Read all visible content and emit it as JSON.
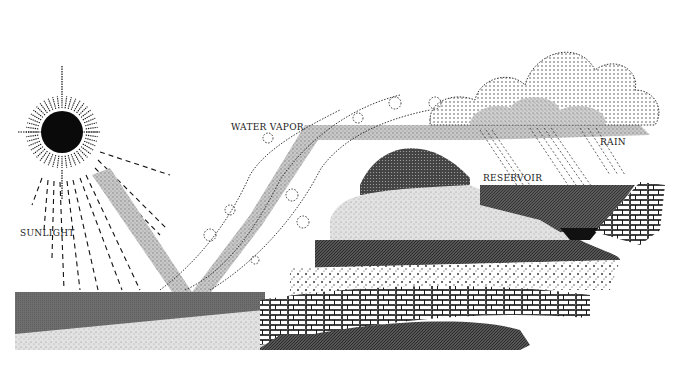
{
  "diagram": {
    "labels": {
      "sunlight": "SUNLIGHT",
      "water_vapor": "WATER VAPOR",
      "rain": "RAIN",
      "reservoir": "RESERVOIR"
    },
    "elements": [
      {
        "name": "sun",
        "description": "black sun disc with radiating dashed rays"
      },
      {
        "name": "sunlight-rays",
        "description": "dashed lines fanning down-right from sun"
      },
      {
        "name": "sunlight-beam",
        "description": "stippled gray band from sun down to sea surface"
      },
      {
        "name": "sea",
        "description": "dark gray water body at lower left"
      },
      {
        "name": "water-vapor-band",
        "description": "stippled gray band rising from sea up and right to clouds"
      },
      {
        "name": "vapor-swirls",
        "description": "dotted spiral curls along the rising vapor"
      },
      {
        "name": "clouds",
        "description": "dotted outline cumulus with stippled shading at upper right"
      },
      {
        "name": "rain",
        "description": "diagonal dashed streaks falling from clouds"
      },
      {
        "name": "mountain-strata",
        "description": "layered rock strata forming a hill"
      },
      {
        "name": "reservoir",
        "description": "dark crosshatched water body on right of hill"
      },
      {
        "name": "dam",
        "description": "brick/stone wall at right edge holding reservoir"
      },
      {
        "name": "bedrock",
        "description": "dark crosshatched bedrock layer at bottom"
      }
    ],
    "colors": {
      "ink": "#111111",
      "stipple_gray": "#9a9a9a",
      "sea": "#6e6e6e",
      "reservoir": "#4d4d4d",
      "background": "#ffffff"
    }
  }
}
